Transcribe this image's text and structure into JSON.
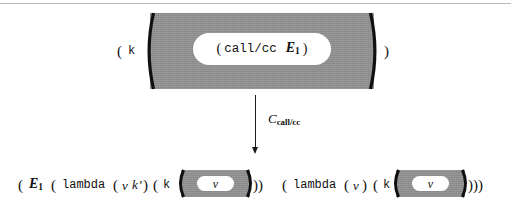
{
  "figure": {
    "title_text": "call/cc conversion rule diagram",
    "colors": {
      "context_gray": "#8f8f8f",
      "hole_white": "#ffffff",
      "ink": "#1a1a1a",
      "rule_gray": "#b9b9b9"
    }
  },
  "top_expression": {
    "open_paren": "(",
    "continuation_var": "k",
    "hole_open_paren": "(",
    "hole_operator": "call/cc",
    "hole_operand": "E",
    "hole_operand_subscript": "1",
    "hole_close_paren": ")",
    "close_paren": ")"
  },
  "arrow": {
    "label_symbol": "C",
    "label_subscript": "call/cc",
    "direction": "down"
  },
  "bottom_expression": {
    "open_paren": "(",
    "applied_expr": "E",
    "applied_expr_subscript": "1",
    "lambda1_open_paren": "(",
    "lambda1_keyword": "lambda",
    "lambda1_params_open": "(",
    "lambda1_param_v": "v",
    "lambda1_param_k": "k’",
    "lambda1_params_close": ")",
    "lambda1_body_open": "(",
    "lambda1_body_k": "k",
    "lambda1_hole_value": "v",
    "lambda1_close": "))",
    "lambda2_open_paren": "(",
    "lambda2_keyword": "lambda",
    "lambda2_params_open": "(",
    "lambda2_param_v": "v",
    "lambda2_params_close": ")",
    "lambda2_body_open": "(",
    "lambda2_body_k": "k",
    "lambda2_hole_value": "v",
    "lambda2_close": ")))"
  }
}
